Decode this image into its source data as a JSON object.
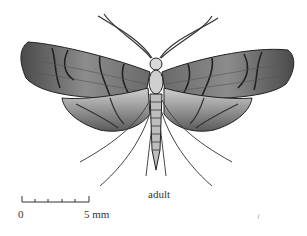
{
  "figure": {
    "caption": "adult",
    "scale_bar": {
      "start_label": "0",
      "end_label": "5 mm",
      "ticks": 6
    },
    "colors": {
      "ink": "#2a2a2a",
      "wing_dark": "#555555",
      "wing_mid": "#8a8a8a",
      "wing_light": "#c4c4c4",
      "background": "#ffffff"
    }
  }
}
